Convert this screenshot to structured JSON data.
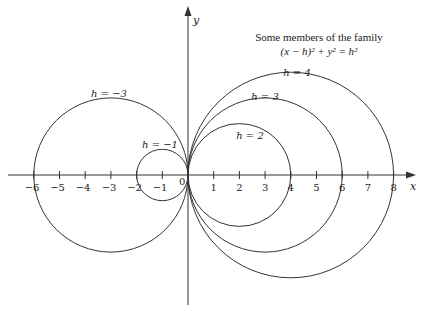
{
  "title": {
    "line1": "Some members of the family",
    "line2": "(x − h)² + y² = h²"
  },
  "axes": {
    "x_label": "x",
    "y_label": "y",
    "origin_label": "0",
    "x_ticks": [
      "−6",
      "−5",
      "−4",
      "−3",
      "−2",
      "−1",
      "1",
      "2",
      "3",
      "4",
      "5",
      "6",
      "7",
      "8"
    ]
  },
  "curves": [
    {
      "h": -3,
      "label": "h = −3"
    },
    {
      "h": -1,
      "label": "h = −1"
    },
    {
      "h": 2,
      "label": "h = 2"
    },
    {
      "h": 3,
      "label": "h = 3"
    },
    {
      "h": 4,
      "label": "h = 4"
    }
  ],
  "colors": {
    "stroke": "#333333",
    "background": "#ffffff"
  }
}
